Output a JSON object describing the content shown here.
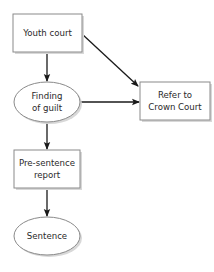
{
  "diagram": {
    "type": "flowchart",
    "colors": {
      "background": "#ffffff",
      "node_fill": "#ffffff",
      "node_border": "#8a8a8a",
      "node_shadow": "#d8d8d8",
      "text": "#2a2a2a",
      "edge": "#1a1a1a"
    },
    "nodes": [
      {
        "id": "youth_court",
        "shape": "rectangle",
        "lines": [
          "Youth court"
        ]
      },
      {
        "id": "finding_of_guilt",
        "shape": "ellipse",
        "lines": [
          "Finding",
          "of guilt"
        ]
      },
      {
        "id": "refer_crown_court",
        "shape": "rectangle",
        "lines": [
          "Refer to",
          "Crown Court"
        ]
      },
      {
        "id": "pre_sentence_report",
        "shape": "rectangle",
        "lines": [
          "Pre-sentence",
          "report"
        ]
      },
      {
        "id": "sentence",
        "shape": "ellipse",
        "lines": [
          "Sentence"
        ]
      }
    ],
    "edges": [
      {
        "from": "youth_court",
        "to": "finding_of_guilt"
      },
      {
        "from": "youth_court",
        "to": "refer_crown_court"
      },
      {
        "from": "finding_of_guilt",
        "to": "refer_crown_court"
      },
      {
        "from": "finding_of_guilt",
        "to": "pre_sentence_report"
      },
      {
        "from": "pre_sentence_report",
        "to": "sentence"
      }
    ]
  }
}
